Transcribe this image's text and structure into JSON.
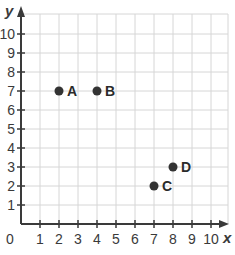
{
  "chart_data": {
    "type": "scatter",
    "title": "",
    "xlabel": "x",
    "ylabel": "y",
    "xlim": [
      0,
      10
    ],
    "ylim": [
      0,
      10
    ],
    "grid": true,
    "x_ticks": [
      "1",
      "2",
      "3",
      "4",
      "5",
      "6",
      "7",
      "8",
      "9",
      "10"
    ],
    "y_ticks": [
      "1",
      "2",
      "3",
      "4",
      "5",
      "6",
      "7",
      "8",
      "9",
      "10"
    ],
    "origin_label": "0",
    "points": [
      {
        "label": "A",
        "x": 2,
        "y": 7
      },
      {
        "label": "B",
        "x": 4,
        "y": 7
      },
      {
        "label": "C",
        "x": 7,
        "y": 2
      },
      {
        "label": "D",
        "x": 8,
        "y": 3
      }
    ],
    "colors": {
      "axis": "#3a3a3a",
      "grid": "#d6d6d6",
      "point": "#333333"
    }
  }
}
